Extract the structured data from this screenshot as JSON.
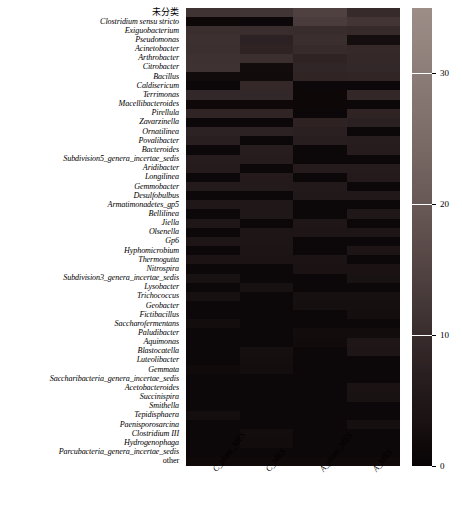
{
  "chart_data": {
    "type": "heatmap",
    "title": "",
    "xlabel": "",
    "ylabel": "",
    "colorbar": {
      "min": 0,
      "max": 35,
      "ticks": [
        0,
        10,
        20,
        30
      ],
      "tick_labels": [
        "0",
        "10",
        "20",
        "30"
      ],
      "colormap": "hot-dark"
    },
    "grid": false,
    "legend_position": "right",
    "columns": [
      "C_plant_MES",
      "C_MES",
      "A_plant_MES",
      "A_MES"
    ],
    "rows": [
      "未分类",
      "Clostridium sensu stricto",
      "Exiguobacterium",
      "Pseudomonas",
      "Acinetobacter",
      "Arthrobacter",
      "Citrobacter",
      "Bacillus",
      "Caldisericum",
      "Terrimonas",
      "Macellibacteroides",
      "Pirellula",
      "Zavarzinella",
      "Ornatilinea",
      "Povalibacter",
      "Bacteroides",
      "Subdivision5_genera_incertae_sedis",
      "Aridibacter",
      "Longilinea",
      "Gemmobacter",
      "Desulfobulbus",
      "Armatimonadetes_gp5",
      "Bellilinea",
      "Jiella",
      "Olsenella",
      "Gp6",
      "Hyphomicrobium",
      "Thermogutta",
      "Nitrospira",
      "Subdivision3_genera_incertae_sedis",
      "Lysobacter",
      "Trichococcus",
      "Geobacter",
      "Fictibacillus",
      "Saccharofermentans",
      "Paludibacter",
      "Aquimonas",
      "Blastocatella",
      "Luteolibacter",
      "Gemmata",
      "Saccharibacteria_genera_incertae_sedis",
      "Acetobacteroides",
      "Succinispira",
      "Smithella",
      "Tepidisphaera",
      "Paenisporosarcina",
      "Clostridium III",
      "Hydrogenophaga",
      "Parcubacteria_genera_incertae_sedis",
      "other"
    ],
    "row_styles": [
      "cjk",
      "italic",
      "italic",
      "italic",
      "italic",
      "italic",
      "italic",
      "italic",
      "italic",
      "italic",
      "italic",
      "italic",
      "italic",
      "italic",
      "italic",
      "italic",
      "italic",
      "italic",
      "italic",
      "italic",
      "italic",
      "italic",
      "italic",
      "italic",
      "italic",
      "italic",
      "italic",
      "italic",
      "italic",
      "italic",
      "italic",
      "italic",
      "italic",
      "italic",
      "italic",
      "italic",
      "italic",
      "italic",
      "italic",
      "italic",
      "italic",
      "italic",
      "italic",
      "italic",
      "italic",
      "italic",
      "italic",
      "italic",
      "italic",
      "upright"
    ],
    "values": [
      [
        11.5,
        11.8,
        14.5,
        9.5
      ],
      [
        1.2,
        1.0,
        13.5,
        12.0
      ],
      [
        10.5,
        10.2,
        10.0,
        9.6
      ],
      [
        10.8,
        7.6,
        10.4,
        2.6
      ],
      [
        10.6,
        8.0,
        9.8,
        9.4
      ],
      [
        11.0,
        10.6,
        8.0,
        9.2
      ],
      [
        11.2,
        2.2,
        8.6,
        9.0
      ],
      [
        2.0,
        2.0,
        8.2,
        8.4
      ],
      [
        1.0,
        9.2,
        1.0,
        1.0
      ],
      [
        9.0,
        9.0,
        1.2,
        8.8
      ],
      [
        1.4,
        1.4,
        1.2,
        1.0
      ],
      [
        8.2,
        8.2,
        1.0,
        8.0
      ],
      [
        1.0,
        1.0,
        7.8,
        7.4
      ],
      [
        7.6,
        7.6,
        7.2,
        1.0
      ],
      [
        7.0,
        1.0,
        6.8,
        6.6
      ],
      [
        1.0,
        6.6,
        1.0,
        6.4
      ],
      [
        6.4,
        6.4,
        1.0,
        1.0
      ],
      [
        6.0,
        1.0,
        6.0,
        6.0
      ],
      [
        1.0,
        5.8,
        1.0,
        5.8
      ],
      [
        5.6,
        5.6,
        5.4,
        1.0
      ],
      [
        1.0,
        1.0,
        5.2,
        5.2
      ],
      [
        5.0,
        5.0,
        1.0,
        1.0
      ],
      [
        1.0,
        4.8,
        1.0,
        4.8
      ],
      [
        4.6,
        1.0,
        4.6,
        1.0
      ],
      [
        1.0,
        4.4,
        4.4,
        4.4
      ],
      [
        4.2,
        4.2,
        1.0,
        1.0
      ],
      [
        1.0,
        4.0,
        1.0,
        4.0
      ],
      [
        3.8,
        3.8,
        3.8,
        1.0
      ],
      [
        1.0,
        1.0,
        3.6,
        3.6
      ],
      [
        3.4,
        1.0,
        1.0,
        3.4
      ],
      [
        1.0,
        3.2,
        1.0,
        1.0
      ],
      [
        3.0,
        1.0,
        3.0,
        3.0
      ],
      [
        1.0,
        1.0,
        2.8,
        2.8
      ],
      [
        1.0,
        1.0,
        1.0,
        2.6
      ],
      [
        2.4,
        1.0,
        1.0,
        1.0
      ],
      [
        1.0,
        1.0,
        2.2,
        2.2
      ],
      [
        1.0,
        1.0,
        2.0,
        4.6
      ],
      [
        1.0,
        2.8,
        1.0,
        4.4
      ],
      [
        1.0,
        2.6,
        1.0,
        1.0
      ],
      [
        1.8,
        2.4,
        1.0,
        1.0
      ],
      [
        1.0,
        1.0,
        1.0,
        1.0
      ],
      [
        1.0,
        1.0,
        1.0,
        3.6
      ],
      [
        1.0,
        1.0,
        1.0,
        3.4
      ],
      [
        1.0,
        1.0,
        1.0,
        1.0
      ],
      [
        2.6,
        1.0,
        1.0,
        1.0
      ],
      [
        1.0,
        1.0,
        1.0,
        2.8
      ],
      [
        1.0,
        2.4,
        1.0,
        1.0
      ],
      [
        1.0,
        2.2,
        1.0,
        1.0
      ],
      [
        1.0,
        1.0,
        1.0,
        1.0
      ],
      [
        1.6,
        1.6,
        1.6,
        1.6
      ]
    ]
  }
}
